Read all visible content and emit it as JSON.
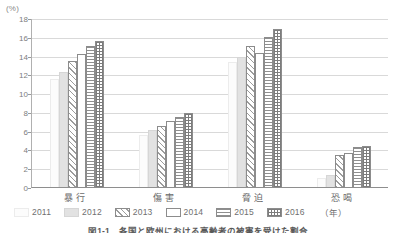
{
  "chart_data": {
    "type": "bar",
    "title": "",
    "unit_label": "(%)",
    "xlabel": "",
    "ylabel": "",
    "ylim": [
      0,
      18
    ],
    "yticks": [
      0,
      2,
      4,
      6,
      8,
      10,
      12,
      14,
      16,
      18
    ],
    "grid": true,
    "legend_position": "bottom",
    "categories": [
      "暴行",
      "傷害",
      "脅迫",
      "恐喝"
    ],
    "series": [
      {
        "name": "2011",
        "pattern": "blank-white",
        "values": [
          11.5,
          5.5,
          13.3,
          1.0
        ]
      },
      {
        "name": "2012",
        "pattern": "solid-lightgray",
        "values": [
          12.2,
          6.1,
          13.9,
          1.3
        ]
      },
      {
        "name": "2013",
        "pattern": "diagonal-hatch",
        "values": [
          13.4,
          6.5,
          15.0,
          3.4
        ]
      },
      {
        "name": "2014",
        "pattern": "white-outline",
        "values": [
          14.2,
          7.0,
          14.3,
          3.6
        ]
      },
      {
        "name": "2015",
        "pattern": "horizontal-lines",
        "values": [
          15.0,
          7.5,
          16.0,
          4.3
        ]
      },
      {
        "name": "2016",
        "pattern": "dotted-grid",
        "values": [
          15.6,
          7.9,
          16.8,
          4.4
        ]
      }
    ]
  },
  "legend": {
    "items": [
      {
        "label": "2011"
      },
      {
        "label": "2012"
      },
      {
        "label": "2013"
      },
      {
        "label": "2014"
      },
      {
        "label": "2015"
      },
      {
        "label": "2016"
      }
    ],
    "year_note": "（年）"
  },
  "caption": {
    "text": "図1-1　各国と欧州における高齢者の被害を受けた割合"
  },
  "colors": {
    "axis": "#8e8e8e",
    "gridline": "#d9d9d9",
    "text": "#6f6f6f",
    "bar_outline": "#8c8c8c",
    "bar_2012_fill": "#e2e2e2"
  }
}
